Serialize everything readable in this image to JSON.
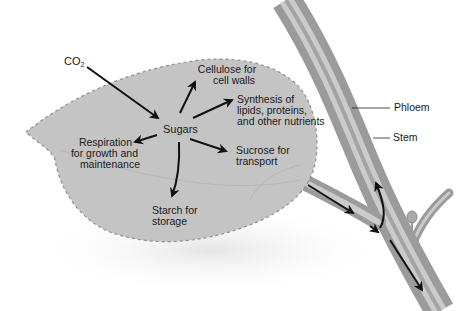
{
  "diagram": {
    "colors": {
      "leaf_fill": "#c4c4c4",
      "leaf_edge": "#8e8e8e",
      "stem_outer": "#9b9b9b",
      "stem_inner": "#cbcbcb",
      "arrow": "#111111",
      "background": "#ffffff"
    },
    "labels": {
      "co2_main": "CO",
      "co2_sub": "2",
      "sugars": "Sugars",
      "cellulose_line1": "Cellulose for",
      "cellulose_line2": "cell walls",
      "synthesis_line1": "Synthesis of",
      "synthesis_line2": "lipids, proteins,",
      "synthesis_line3": "and other nutrients",
      "respiration_line1": "Respiration",
      "respiration_line2": "for growth and",
      "respiration_line3": "maintenance",
      "sucrose_line1": "Sucrose for",
      "sucrose_line2": "transport",
      "starch_line1": "Starch for",
      "starch_line2": "storage",
      "phloem": "Phloem",
      "stem": "Stem"
    },
    "nodes": [
      {
        "id": "co2",
        "label": "CO2"
      },
      {
        "id": "sugars",
        "label": "Sugars"
      },
      {
        "id": "cellulose",
        "label": "Cellulose for cell walls"
      },
      {
        "id": "synthesis",
        "label": "Synthesis of lipids, proteins, and other nutrients"
      },
      {
        "id": "respiration",
        "label": "Respiration for growth and maintenance"
      },
      {
        "id": "sucrose",
        "label": "Sucrose for transport"
      },
      {
        "id": "starch",
        "label": "Starch for storage"
      },
      {
        "id": "phloem",
        "label": "Phloem"
      },
      {
        "id": "stem",
        "label": "Stem"
      }
    ],
    "edges": [
      {
        "from": "co2",
        "to": "sugars"
      },
      {
        "from": "sugars",
        "to": "cellulose"
      },
      {
        "from": "sugars",
        "to": "synthesis"
      },
      {
        "from": "sugars",
        "to": "respiration"
      },
      {
        "from": "sugars",
        "to": "sucrose"
      },
      {
        "from": "sugars",
        "to": "starch"
      },
      {
        "from": "sucrose",
        "to": "phloem"
      }
    ]
  }
}
